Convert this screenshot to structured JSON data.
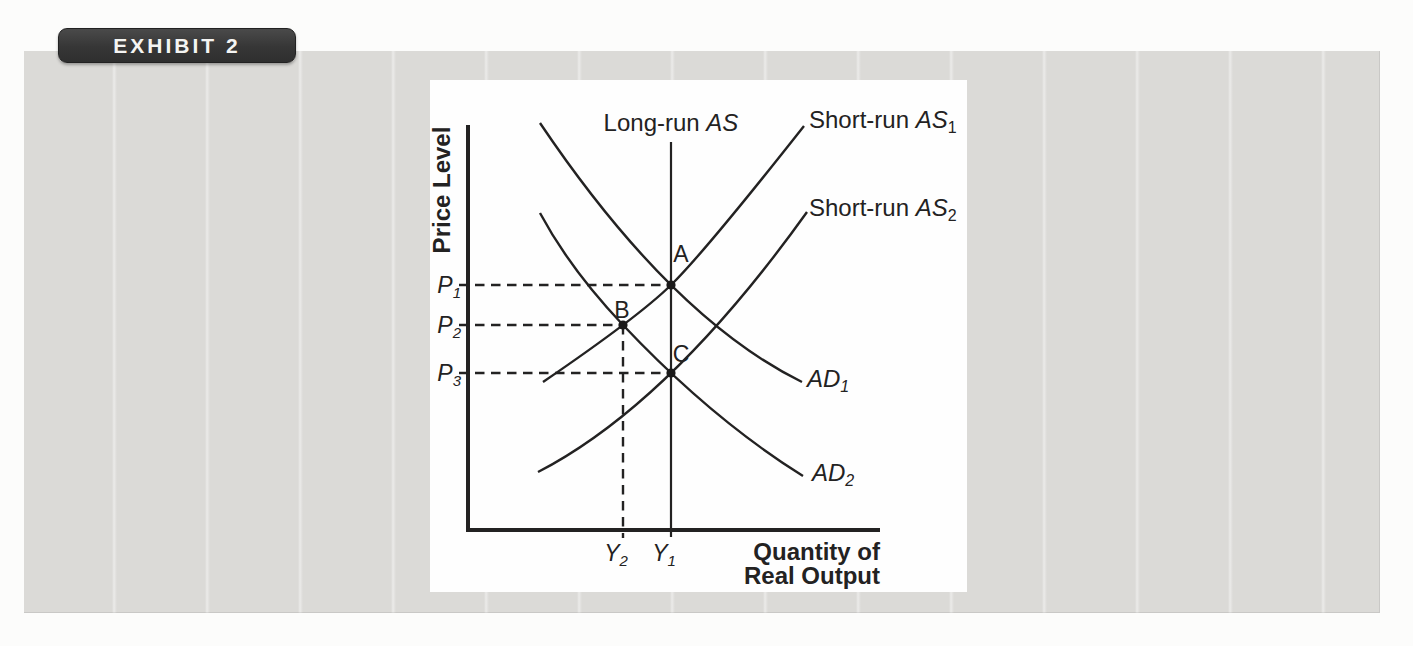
{
  "exhibit": {
    "label": "EXHIBIT 2"
  },
  "diagram": {
    "y_axis_title": "Price Level",
    "x_axis_title": {
      "line1": "Quantity of",
      "line2": "Real Output"
    },
    "curves": {
      "long_run_as": {
        "prefix": "Long-run ",
        "symbol": "AS",
        "sub": ""
      },
      "short_run_as1": {
        "prefix": "Short-run ",
        "symbol": "AS",
        "sub": "1"
      },
      "short_run_as2": {
        "prefix": "Short-run ",
        "symbol": "AS",
        "sub": "2"
      },
      "ad1": {
        "prefix": "",
        "symbol": "AD",
        "sub": "1"
      },
      "ad2": {
        "prefix": "",
        "symbol": "AD",
        "sub": "2"
      }
    },
    "price_labels": [
      {
        "symbol": "P",
        "sub": "1"
      },
      {
        "symbol": "P",
        "sub": "2"
      },
      {
        "symbol": "P",
        "sub": "3"
      }
    ],
    "quantity_labels": [
      {
        "symbol": "Y",
        "sub": "2"
      },
      {
        "symbol": "Y",
        "sub": "1"
      }
    ],
    "points": [
      {
        "label": "A",
        "price": "P1",
        "quantity": "Y1"
      },
      {
        "label": "B",
        "price": "P2",
        "quantity": "Y2"
      },
      {
        "label": "C",
        "price": "P3",
        "quantity": "Y1"
      }
    ]
  },
  "colors": {
    "panel_gray": "#dbdad7",
    "chart_bg": "#fefefe",
    "ink": "#232222",
    "badge_bg": "#3b3b3b",
    "badge_text": "#f4f4f2"
  }
}
